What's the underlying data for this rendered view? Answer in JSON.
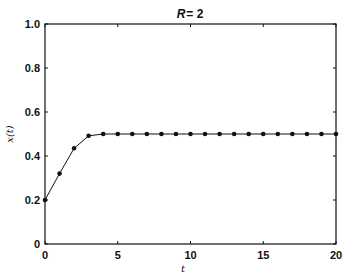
{
  "chart_data": {
    "type": "line",
    "title_parts": {
      "var": "R",
      "rest": "= 2"
    },
    "xlabel": "t",
    "ylabel": "x(t)",
    "xlim": [
      0,
      20
    ],
    "ylim": [
      0,
      1.0
    ],
    "xticks": [
      0,
      5,
      10,
      15,
      20
    ],
    "xtick_labels": [
      "0",
      "5",
      "10",
      "15",
      "20"
    ],
    "yticks": [
      0,
      0.2,
      0.4,
      0.6,
      0.8,
      1.0
    ],
    "ytick_labels": [
      "0",
      "0.2",
      "0.4",
      "0.6",
      "0.8",
      "1.0"
    ],
    "grid": false,
    "legend": null,
    "series": [
      {
        "name": "x(t)",
        "marker": "circle",
        "color": "#111111",
        "x": [
          0,
          1,
          2,
          3,
          4,
          5,
          6,
          7,
          8,
          9,
          10,
          11,
          12,
          13,
          14,
          15,
          16,
          17,
          18,
          19,
          20
        ],
        "values": [
          0.2,
          0.32,
          0.435,
          0.492,
          0.5,
          0.5,
          0.5,
          0.5,
          0.5,
          0.5,
          0.5,
          0.5,
          0.5,
          0.5,
          0.5,
          0.5,
          0.5,
          0.5,
          0.5,
          0.5,
          0.5
        ]
      }
    ]
  }
}
